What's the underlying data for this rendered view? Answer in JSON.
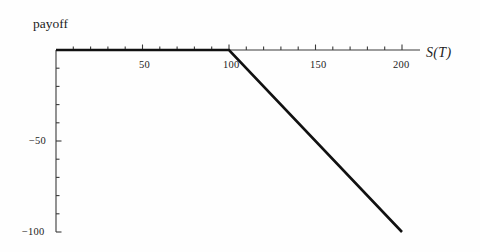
{
  "figure": {
    "background_color": "#fefefe",
    "line_color": "#111111",
    "axis_color": "#3a3a3a"
  },
  "axes": {
    "y_title": "payoff",
    "x_title": "S(T)",
    "x_title_parts": {
      "symbol": "S",
      "open_paren": "(",
      "argument": "T",
      "close_paren": ")"
    },
    "x_tick_labels": [
      "50",
      "100",
      "150",
      "200"
    ],
    "y_tick_labels": [
      "−50",
      "−100"
    ]
  },
  "chart_data": {
    "type": "line",
    "title": "",
    "subtitle": "",
    "xlabel": "S(T)",
    "ylabel": "payoff",
    "xlim": [
      0,
      200
    ],
    "ylim": [
      -100,
      0
    ],
    "grid": false,
    "legend": null,
    "xticks": [
      0,
      10,
      20,
      30,
      40,
      50,
      60,
      70,
      80,
      90,
      100,
      110,
      120,
      130,
      140,
      150,
      160,
      170,
      180,
      190,
      200
    ],
    "xtick_labels_shown": [
      50,
      100,
      150,
      200
    ],
    "yticks": [
      0,
      -10,
      -20,
      -30,
      -40,
      -50,
      -60,
      -70,
      -80,
      -90,
      -100
    ],
    "ytick_labels_shown": [
      -50,
      -100
    ],
    "series": [
      {
        "name": "short call payoff",
        "strike": 100,
        "x": [
          0,
          100,
          200
        ],
        "y": [
          0,
          0,
          -100
        ],
        "color": "#111111",
        "linewidth": 2.6
      }
    ],
    "annotations": []
  }
}
